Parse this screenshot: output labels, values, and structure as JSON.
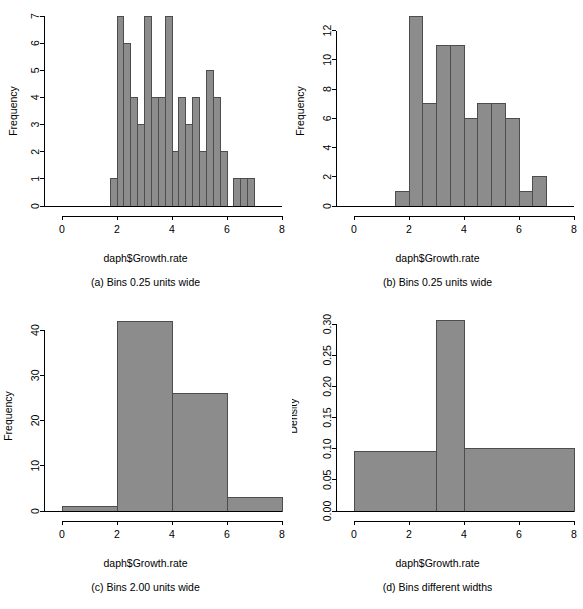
{
  "figure": {
    "background": "#ffffff",
    "bar_fill": "#8c8c8c",
    "bar_stroke": "#4d4d4d",
    "axis_color": "#000000"
  },
  "panels": [
    {
      "id": "a",
      "caption": "(a) Bins 0.25 units wide",
      "xlabel": "daph$Growth.rate",
      "ylabel": "Frequency"
    },
    {
      "id": "b",
      "caption": "(b) Bins 0.25 units wide",
      "xlabel": "daph$Growth.rate",
      "ylabel": "Frequency"
    },
    {
      "id": "c",
      "caption": "(c) Bins 2.00 units wide",
      "xlabel": "daph$Growth.rate",
      "ylabel": "Frequency"
    },
    {
      "id": "d",
      "caption": "(d) Bins different widths",
      "xlabel": "daph$Growth.rate",
      "ylabel": "Density"
    }
  ],
  "chart_data": [
    {
      "type": "bar",
      "subtype": "histogram",
      "panel": "a",
      "title": "(a) Bins 0.25 units wide",
      "xlabel": "daph$Growth.rate",
      "ylabel": "Frequency",
      "xlim": [
        0,
        8
      ],
      "ylim": [
        0,
        7
      ],
      "xticks": [
        0,
        2,
        4,
        6,
        8
      ],
      "yticks": [
        0,
        1,
        2,
        3,
        4,
        5,
        6,
        7
      ],
      "xticklabels": [
        "0",
        "2",
        "4",
        "6",
        "8"
      ],
      "yticklabels": [
        "0",
        "1",
        "2",
        "3",
        "4",
        "5",
        "6",
        "7"
      ],
      "grid": false,
      "legend": false,
      "bin_width": 0.25,
      "bin_edges": [
        1.75,
        2.0,
        2.25,
        2.5,
        2.75,
        3.0,
        3.25,
        3.5,
        3.75,
        4.0,
        4.25,
        4.5,
        4.75,
        5.0,
        5.25,
        5.5,
        5.75,
        6.0,
        6.25,
        6.5,
        6.75,
        7.0
      ],
      "values": [
        1,
        7,
        6,
        4,
        3,
        7,
        4,
        4,
        7,
        2,
        4,
        3,
        4,
        2,
        5,
        4,
        2,
        0,
        1,
        1,
        1
      ]
    },
    {
      "type": "bar",
      "subtype": "histogram",
      "panel": "b",
      "title": "(b) Bins 0.25 units wide",
      "xlabel": "daph$Growth.rate",
      "ylabel": "Frequency",
      "xlim": [
        0,
        8
      ],
      "ylim": [
        0,
        13
      ],
      "xticks": [
        0,
        2,
        4,
        6,
        8
      ],
      "yticks": [
        0,
        2,
        4,
        6,
        8,
        10,
        12
      ],
      "xticklabels": [
        "0",
        "2",
        "4",
        "6",
        "8"
      ],
      "yticklabels": [
        "0",
        "2",
        "4",
        "6",
        "8",
        "10",
        "12"
      ],
      "grid": false,
      "legend": false,
      "bin_width": 0.5,
      "bin_edges": [
        1.5,
        2.0,
        2.5,
        3.0,
        3.5,
        4.0,
        4.5,
        5.0,
        5.5,
        6.0,
        6.5,
        7.0
      ],
      "values": [
        1,
        13,
        7,
        11,
        11,
        6,
        7,
        7,
        6,
        1,
        2
      ]
    },
    {
      "type": "bar",
      "subtype": "histogram",
      "panel": "c",
      "title": "(c) Bins 2.00 units wide",
      "xlabel": "daph$Growth.rate",
      "ylabel": "Frequency",
      "xlim": [
        0,
        8
      ],
      "ylim": [
        0,
        42
      ],
      "xticks": [
        0,
        2,
        4,
        6,
        8
      ],
      "yticks": [
        0,
        10,
        20,
        30,
        40
      ],
      "xticklabels": [
        "0",
        "10",
        "20",
        "30",
        "40"
      ],
      "yticklabels": [
        "0",
        "10",
        "20",
        "30",
        "40"
      ],
      "grid": false,
      "legend": false,
      "bin_width": 2.0,
      "bin_edges": [
        0,
        2,
        4,
        6,
        8
      ],
      "values": [
        1,
        42,
        26,
        3
      ]
    },
    {
      "type": "bar",
      "subtype": "histogram-density",
      "panel": "d",
      "title": "(d) Bins different widths",
      "xlabel": "daph$Growth.rate",
      "ylabel": "Density",
      "xlim": [
        0,
        8
      ],
      "ylim": [
        0,
        0.305
      ],
      "xticks": [
        0,
        2,
        4,
        6,
        8
      ],
      "yticks": [
        0.0,
        0.05,
        0.1,
        0.15,
        0.2,
        0.25,
        0.3
      ],
      "xticklabels": [
        "0",
        "2",
        "4",
        "6",
        "8"
      ],
      "yticklabels": [
        "0.00",
        "0.05",
        "0.10",
        "0.15",
        "0.20",
        "0.25",
        "0.30"
      ],
      "grid": false,
      "legend": false,
      "bin_edges": [
        0,
        3,
        4,
        8
      ],
      "values": [
        0.0958,
        0.3056,
        0.1
      ]
    }
  ]
}
